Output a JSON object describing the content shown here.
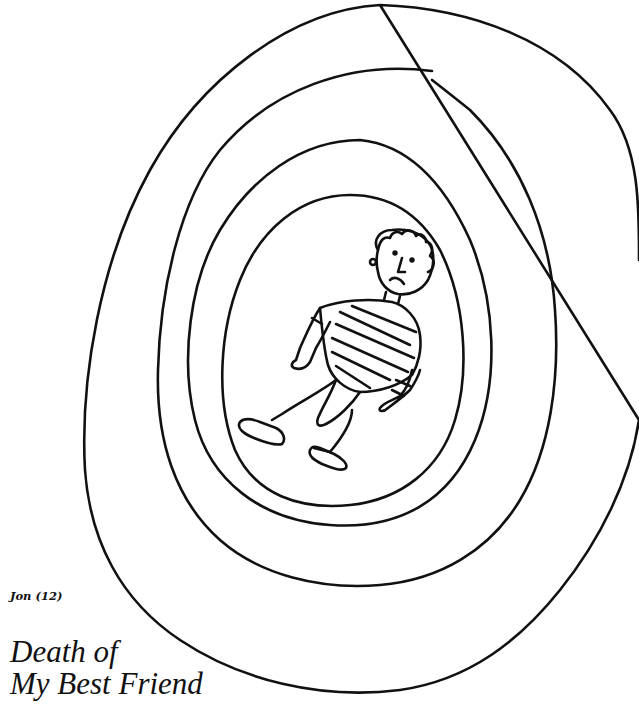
{
  "artwork": {
    "description": "Child's drawing of a sad boy in a striped shirt lying inside three concentric hand-drawn rings",
    "rings": 3,
    "figure": "boy-in-striped-shirt",
    "ink_color": "#111111",
    "background_color": "#ffffff"
  },
  "caption": {
    "author": "Jon (12)",
    "title_line1": "Death of",
    "title_line2": "My Best Friend"
  }
}
